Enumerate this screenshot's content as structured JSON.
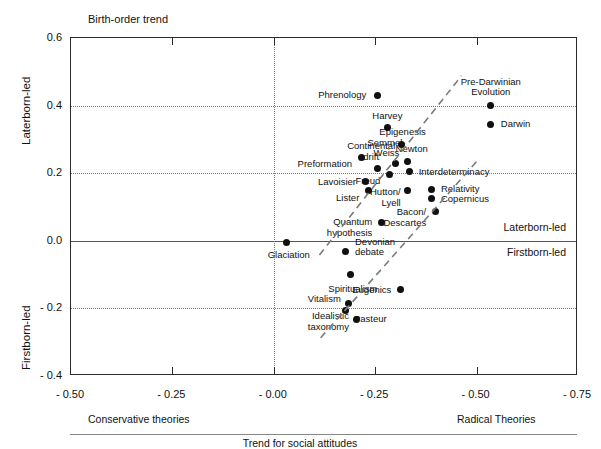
{
  "chart_data": {
    "type": "scatter",
    "title": "Birth-order trend",
    "xlabel": "Trend for social attitudes",
    "ylabel_top": "Laterborn-led",
    "ylabel_bottom": "Firstborn-led",
    "xlim": [
      -0.5,
      -0.75
    ],
    "ylim": [
      -0.4,
      0.6
    ],
    "grid": true,
    "legend": "none",
    "x_ticks": [
      "- 0.50",
      "- 0.25",
      "- 0.00",
      "- 0.25",
      "- 0.50",
      "- 0.75"
    ],
    "y_ticks": [
      "0.6",
      "0.4",
      "0.2",
      "0.0",
      "- 0.2",
      "- 0.4"
    ],
    "x_axis_left_note": "Conservative theories",
    "x_axis_right_note": "Radical Theories",
    "in_plot_note_above_zero": "Laterborn-led",
    "in_plot_note_below_zero": "Firstborn-led",
    "points": [
      {
        "label": "Phrenology",
        "x": -0.255,
        "y": 0.43,
        "lp": "r",
        "dx": -11,
        "dy": 0
      },
      {
        "label": "Pre-Darwinian\nEvolution",
        "x": -0.535,
        "y": 0.4,
        "lp": "c",
        "dx": 0,
        "dy": -19
      },
      {
        "label": "Darwin",
        "x": -0.535,
        "y": 0.345,
        "lp": "l",
        "dx": 10,
        "dy": 0
      },
      {
        "label": "Harvey",
        "x": -0.28,
        "y": 0.335,
        "lp": "c",
        "dx": 0,
        "dy": -12
      },
      {
        "label": "Epigenesis",
        "x": -0.315,
        "y": 0.285,
        "lp": "c",
        "dx": 1,
        "dy": -12
      },
      {
        "label": "Newton",
        "x": -0.33,
        "y": 0.235,
        "lp": "c",
        "dx": 4,
        "dy": -12
      },
      {
        "label": "Semmel-\nWeiss",
        "x": -0.3,
        "y": 0.228,
        "lp": "c",
        "dx": -9,
        "dy": -16
      },
      {
        "label": "Continental\ndrift",
        "x": -0.255,
        "y": 0.215,
        "lp": "c",
        "dx": -6,
        "dy": -17
      },
      {
        "label": "Preformation",
        "x": -0.215,
        "y": 0.245,
        "lp": "r",
        "dx": -9,
        "dy": 6
      },
      {
        "label": "Interdeterminacy",
        "x": -0.335,
        "y": 0.205,
        "lp": "l",
        "dx": 9,
        "dy": 0
      },
      {
        "label": "Freud",
        "x": -0.285,
        "y": 0.195,
        "lp": "r",
        "dx": -9,
        "dy": 6
      },
      {
        "label": "Lavoisier",
        "x": -0.225,
        "y": 0.175,
        "lp": "r",
        "dx": -9,
        "dy": 0
      },
      {
        "label": "Lister",
        "x": -0.233,
        "y": 0.148,
        "lp": "r",
        "dx": -9,
        "dy": 7
      },
      {
        "label": "Hutton/\nLyell",
        "x": -0.33,
        "y": 0.15,
        "lp": "r",
        "dx": -7,
        "dy": 7
      },
      {
        "label": "Relativity",
        "x": -0.39,
        "y": 0.152,
        "lp": "l",
        "dx": 9,
        "dy": 0
      },
      {
        "label": "Copernicus",
        "x": -0.39,
        "y": 0.125,
        "lp": "l",
        "dx": 9,
        "dy": 0
      },
      {
        "label": "Bacon/\nDescartes",
        "x": -0.398,
        "y": 0.088,
        "lp": "r",
        "dx": -9,
        "dy": 6
      },
      {
        "label": "Quantum\nhypothesis",
        "x": -0.265,
        "y": 0.055,
        "lp": "r",
        "dx": -9,
        "dy": 5
      },
      {
        "label": "Devonian\ndebate",
        "x": -0.178,
        "y": -0.032,
        "lp": "l",
        "dx": 9,
        "dy": -5
      },
      {
        "label": "Glaciation",
        "x": -0.032,
        "y": -0.005,
        "lp": "c",
        "dx": 2,
        "dy": 13
      },
      {
        "label": "Spiritualism",
        "x": -0.19,
        "y": -0.1,
        "lp": "c",
        "dx": 2,
        "dy": 14
      },
      {
        "label": "Eugenics",
        "x": -0.312,
        "y": -0.145,
        "lp": "r",
        "dx": -9,
        "dy": 0
      },
      {
        "label": "Vitalism",
        "x": -0.185,
        "y": -0.185,
        "lp": "r",
        "dx": -8,
        "dy": -4
      },
      {
        "label": "Pasteur",
        "x": -0.178,
        "y": -0.205,
        "lp": "l",
        "dx": 8,
        "dy": 9
      },
      {
        "label": "Idealistic\ntaxonomy",
        "x": -0.205,
        "y": -0.232,
        "lp": "r",
        "dx": -8,
        "dy": 2
      }
    ],
    "trend_lines": [
      {
        "name": "upper-trend",
        "x1": -0.115,
        "y1": -0.045,
        "x2": -0.465,
        "y2": 0.485
      },
      {
        "name": "lower-trend",
        "x1": -0.118,
        "y1": -0.29,
        "x2": -0.505,
        "y2": 0.235
      }
    ]
  }
}
